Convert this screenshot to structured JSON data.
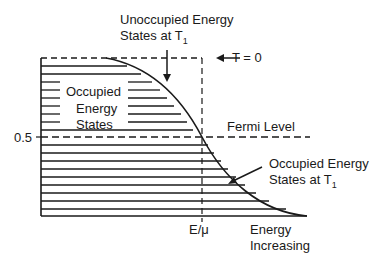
{
  "diagram": {
    "labels": {
      "unoccupied_line1": "Unoccupied Energy",
      "unoccupied_line2": "States at T",
      "unoccupied_sub": "1",
      "t_zero": "T = 0",
      "occupied_line1": "Occupied",
      "occupied_line2": "Energy",
      "occupied_line3": "States",
      "fermi_level": "Fermi Level",
      "y_tick": "0.5",
      "occupied_t1_line1": "Occupied Energy",
      "occupied_t1_line2": "States at T",
      "occupied_t1_sub": "1",
      "x_marker": "E/μ",
      "energy_line1": "Energy",
      "energy_line2": "Increasing"
    },
    "colors": {
      "ink": "#1a1a1a",
      "background": "#ffffff"
    }
  }
}
